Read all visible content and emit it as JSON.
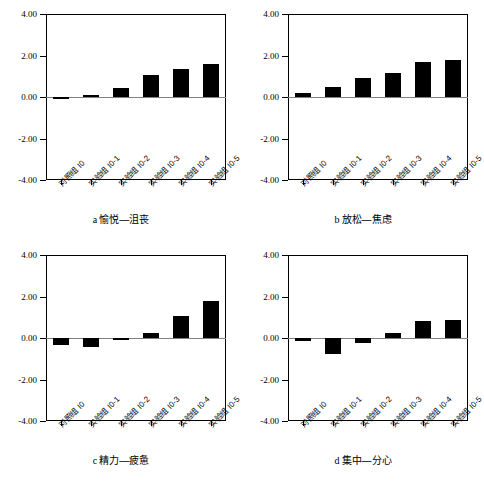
{
  "figure": {
    "background": "#ffffff",
    "bar_color": "#000000",
    "axis_color": "#000000",
    "zero_line_color": "#808080"
  },
  "axis": {
    "y_ticks": [
      "4.00",
      "2.00",
      "0.00",
      "-2.00",
      "-4.00"
    ],
    "y_tick_values": [
      4,
      2,
      0,
      -2,
      -4
    ],
    "ylim": [
      -4,
      4
    ],
    "categories": [
      "对照组 I0",
      "实验组 I0-1",
      "实验组 I0-2",
      "实验组 I0-3",
      "实验组 I0-4",
      "实验组 I0-5"
    ]
  },
  "panels": [
    {
      "id": "a",
      "letter": "a",
      "caption": "愉悦—沮丧",
      "caption_full": "a 愉悦—沮丧",
      "values": [
        -0.08,
        0.12,
        0.42,
        1.05,
        1.35,
        1.6
      ]
    },
    {
      "id": "b",
      "letter": "b",
      "caption": "放松—焦虑",
      "caption_full": "b 放松—焦虑",
      "values": [
        0.18,
        0.5,
        0.9,
        1.15,
        1.68,
        1.8
      ]
    },
    {
      "id": "c",
      "letter": "c",
      "caption": "精力—疲惫",
      "caption_full": "c 精力—疲惫",
      "values": [
        -0.35,
        -0.45,
        -0.08,
        0.25,
        1.05,
        1.8
      ]
    },
    {
      "id": "d",
      "letter": "d",
      "caption": "集中—分心",
      "caption_full": "d 集中—分心",
      "values": [
        -0.15,
        -0.75,
        -0.22,
        0.22,
        0.82,
        0.85
      ]
    }
  ],
  "chart_data": {
    "type": "bar",
    "title": "",
    "xlabel": "",
    "ylabel": "",
    "ylim": [
      -4,
      4
    ],
    "grid": false,
    "legend": "none",
    "y_ticks": [
      4,
      2,
      0,
      -2,
      -4
    ],
    "y_tick_labels": [
      "4.00",
      "2.00",
      "0.00",
      "-2.00",
      "-4.00"
    ],
    "categories": [
      "对照组 I0",
      "实验组 I0-1",
      "实验组 I0-2",
      "实验组 I0-3",
      "实验组 I0-4",
      "实验组 I0-5"
    ],
    "subplots": [
      {
        "panel": "a",
        "title": "a 愉悦—沮丧",
        "values": [
          -0.08,
          0.12,
          0.42,
          1.05,
          1.35,
          1.6
        ]
      },
      {
        "panel": "b",
        "title": "b 放松—焦虑",
        "values": [
          0.18,
          0.5,
          0.9,
          1.15,
          1.68,
          1.8
        ]
      },
      {
        "panel": "c",
        "title": "c 精力—疲惫",
        "values": [
          -0.35,
          -0.45,
          -0.08,
          0.25,
          1.05,
          1.8
        ]
      },
      {
        "panel": "d",
        "title": "d 集中—分心",
        "values": [
          -0.15,
          -0.75,
          -0.22,
          0.22,
          0.82,
          0.85
        ]
      }
    ]
  }
}
